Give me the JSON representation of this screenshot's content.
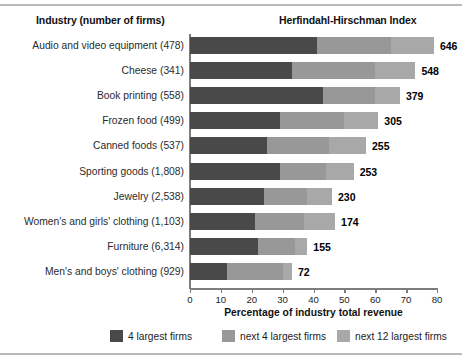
{
  "header": {
    "left_title": "Industry (number of firms)",
    "right_title": "Herfindahl-Hirschman Index"
  },
  "axis": {
    "x_title": "Percentage of industry total revenue",
    "x_ticks": [
      "0",
      "10",
      "20",
      "30",
      "40",
      "50",
      "60",
      "70",
      "80"
    ],
    "x_min": 0,
    "x_max": 80
  },
  "legend": [
    {
      "label": "4 largest firms",
      "color": "#494949",
      "key": "c4"
    },
    {
      "label": "next 4 largest firms",
      "color": "#989898",
      "key": "c8"
    },
    {
      "label": "next 12 largest firms",
      "color": "#a8a8a8",
      "key": "c20"
    }
  ],
  "colors": {
    "series1": "#494949",
    "series2": "#989898",
    "series3": "#a8a8a8",
    "axis": "#7d7d7d",
    "rule": "#b9b9b9"
  },
  "chart_data": {
    "type": "bar",
    "orientation": "horizontal",
    "stacked": true,
    "title": "Herfindahl-Hirschman Index",
    "xlabel": "Percentage of industry total revenue",
    "ylabel": "Industry (number of firms)",
    "xlim": [
      0,
      80
    ],
    "grid": false,
    "legend_position": "bottom",
    "categories": [
      "Audio and video equipment (478)",
      "Cheese (341)",
      "Book printing (558)",
      "Frozen food (499)",
      "Canned foods (537)",
      "Sporting goods (1,808)",
      "Jewelry (2,538)",
      "Women's and girls' clothing (1,103)",
      "Furniture (6,314)",
      "Men's and boys' clothing (929)"
    ],
    "series": [
      {
        "name": "4 largest firms",
        "values": [
          41,
          33,
          43,
          29,
          25,
          29,
          24,
          21,
          22,
          12
        ]
      },
      {
        "name": "next 4 largest firms",
        "values": [
          24,
          27,
          17,
          21,
          20,
          15,
          14,
          16,
          12,
          18
        ]
      },
      {
        "name": "next 12 largest firms",
        "values": [
          14,
          13,
          8,
          11,
          12,
          9,
          8,
          10,
          4,
          3
        ]
      }
    ],
    "annotations": {
      "name": "Herfindahl-Hirschman Index",
      "values": [
        646,
        548,
        379,
        305,
        255,
        253,
        230,
        174,
        155,
        72
      ]
    },
    "rows": [
      {
        "label": "Audio and video equipment (478)",
        "hhi": "646",
        "s1": 41,
        "s2": 24,
        "s3": 14
      },
      {
        "label": "Cheese (341)",
        "hhi": "548",
        "s1": 33,
        "s2": 27,
        "s3": 13
      },
      {
        "label": "Book printing (558)",
        "hhi": "379",
        "s1": 43,
        "s2": 17,
        "s3": 8
      },
      {
        "label": "Frozen food (499)",
        "hhi": "305",
        "s1": 29,
        "s2": 21,
        "s3": 11
      },
      {
        "label": "Canned foods (537)",
        "hhi": "255",
        "s1": 25,
        "s2": 20,
        "s3": 12
      },
      {
        "label": "Sporting goods (1,808)",
        "hhi": "253",
        "s1": 29,
        "s2": 15,
        "s3": 9
      },
      {
        "label": "Jewelry (2,538)",
        "hhi": "230",
        "s1": 24,
        "s2": 14,
        "s3": 8
      },
      {
        "label": "Women's and girls' clothing (1,103)",
        "hhi": "174",
        "s1": 21,
        "s2": 16,
        "s3": 10
      },
      {
        "label": "Furniture (6,314)",
        "hhi": "155",
        "s1": 22,
        "s2": 12,
        "s3": 4
      },
      {
        "label": "Men's and boys' clothing (929)",
        "hhi": "72",
        "s1": 12,
        "s2": 18,
        "s3": 3
      }
    ]
  }
}
